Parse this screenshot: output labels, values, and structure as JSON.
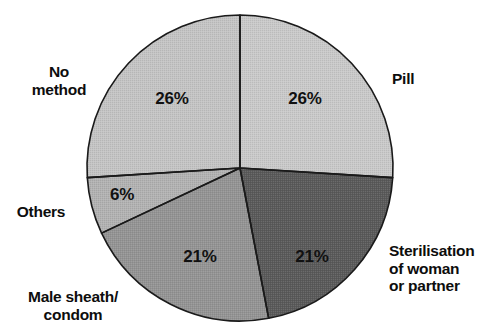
{
  "chart_data": {
    "type": "pie",
    "title": "",
    "categories": [
      "Pill",
      "Sterilisation of woman or partner",
      "Male sheath/condom",
      "Others",
      "No method"
    ],
    "values": [
      26,
      21,
      21,
      6,
      26
    ],
    "value_labels": [
      "26%",
      "21%",
      "21%",
      "6%",
      "26%"
    ],
    "unit": "%",
    "legend": "none",
    "grid": false,
    "colors": [
      "#c9c9c9",
      "#5a5a5a",
      "#949494",
      "#b2b2b2",
      "#c4c4c4"
    ],
    "start_angle_deg": 0,
    "direction": "clockwise",
    "outline_color": "#1a1a1a"
  },
  "slices": [
    {
      "key": "pill",
      "name": "Pill",
      "label_lines": "Pill",
      "percent_text": "26%",
      "value": 26,
      "color": "#c9c9c9",
      "percent_x": 305,
      "percent_y": 99,
      "label_x": 392,
      "label_y": 79,
      "label_align": "c-left"
    },
    {
      "key": "sterilisation",
      "name": "Sterilisation of woman or partner",
      "label_lines": "Sterilisation\nof woman\nor partner",
      "percent_text": "21%",
      "value": 21,
      "color": "#5a5a5a",
      "percent_x": 312,
      "percent_y": 257,
      "label_x": 389,
      "label_y": 268,
      "label_align": "c-left"
    },
    {
      "key": "male-sheath-condom",
      "name": "Male sheath/condom",
      "label_lines": "Male sheath/\ncondom",
      "percent_text": "21%",
      "value": 21,
      "color": "#949494",
      "percent_x": 200,
      "percent_y": 257,
      "label_x": 73,
      "label_y": 305,
      "label_align": "c-center"
    },
    {
      "key": "others",
      "name": "Others",
      "label_lines": "Others",
      "percent_text": "6%",
      "value": 6,
      "color": "#b2b2b2",
      "percent_x": 122,
      "percent_y": 195,
      "label_x": 41,
      "label_y": 212,
      "label_align": "c-center"
    },
    {
      "key": "no-method",
      "name": "No method",
      "label_lines": "No\nmethod",
      "percent_text": "26%",
      "value": 26,
      "color": "#c4c4c4",
      "percent_x": 172,
      "percent_y": 99,
      "label_x": 59,
      "label_y": 80,
      "label_align": "c-center"
    }
  ],
  "geometry": {
    "center_x": 240,
    "center_y": 168,
    "radius": 153
  }
}
